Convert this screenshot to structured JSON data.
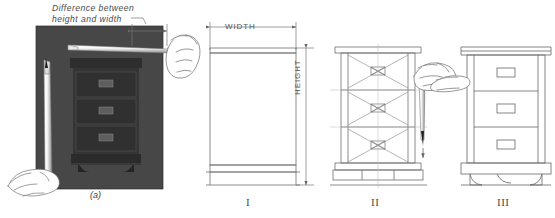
{
  "figure": {
    "background_color": "#ffffff",
    "ink_color": "#555555",
    "photo_color": "#3f3f3f",
    "annotations": {
      "difference_note_line1": "Difference between",
      "difference_note_line2": "height and width",
      "width_label": "WIDTH",
      "height_label": "HEIGHT"
    },
    "panels": [
      {
        "id": "panel-a",
        "tag": "(a)",
        "type": "photograph",
        "description": "dark photo of a three-drawer chest with pencils held for sight measuring",
        "icons": [
          "pencil-horizontal-icon",
          "pencil-vertical-icon",
          "hand-icon"
        ]
      },
      {
        "id": "panel-i",
        "tag": "I",
        "type": "line-drawing",
        "description": "plain rectangle block with width and height dimensions"
      },
      {
        "id": "panel-ii",
        "tag": "II",
        "type": "line-drawing",
        "description": "carcase divided by diagonals into three drawer bays with bowtie centres"
      },
      {
        "id": "panel-iii",
        "tag": "III",
        "type": "line-drawing",
        "description": "finished chest of drawers with top overhang, three drawers with handles and bracket-foot plinth"
      }
    ]
  }
}
